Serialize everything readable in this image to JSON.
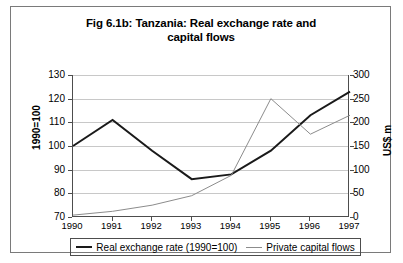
{
  "chart_data": {
    "type": "line",
    "title": "Fig 6.1b: Tanzania: Real exchange rate and capital flows",
    "title_line1": "Fig 6.1b: Tanzania: Real exchange rate and",
    "title_line2": "capital flows",
    "xlabel": "",
    "ylabel": "1990=100",
    "y2label": "US$ m",
    "categories": [
      "1990",
      "1991",
      "1992",
      "1993",
      "1994",
      "1995",
      "1996",
      "1997"
    ],
    "ylim": [
      70,
      130
    ],
    "y2lim": [
      0,
      300
    ],
    "yticks": [
      70,
      80,
      90,
      100,
      110,
      120,
      130
    ],
    "y2ticks": [
      0,
      50,
      100,
      150,
      200,
      250,
      300
    ],
    "grid": true,
    "legend_position": "bottom",
    "series": [
      {
        "name": "Real exchange rate (1990=100)",
        "axis": "left",
        "color": "#1a1a1a",
        "width": 2,
        "values": [
          100,
          111,
          98,
          86,
          88,
          98,
          113,
          123
        ]
      },
      {
        "name": "Private capital flows",
        "axis": "right",
        "color": "#8c8c8c",
        "width": 1,
        "values": [
          4,
          12,
          25,
          45,
          88,
          250,
          175,
          215
        ]
      }
    ]
  },
  "legend": {
    "entries": [
      {
        "label": "Real exchange rate (1990=100)"
      },
      {
        "label": "Private capital flows"
      }
    ]
  }
}
